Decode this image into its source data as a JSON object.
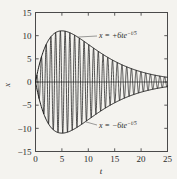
{
  "chart_data": {
    "type": "line",
    "title": "",
    "subtitle": "",
    "xlabel": "t",
    "ylabel": "x",
    "xlim": [
      0,
      25
    ],
    "ylim": [
      -15,
      15
    ],
    "grid": false,
    "legend_position": "none",
    "xticks": [
      0,
      5,
      10,
      15,
      20,
      25
    ],
    "xtick_labels": [
      "0",
      "5",
      "10",
      "15",
      "20",
      "25"
    ],
    "yticks": [
      -15,
      -10,
      -5,
      0,
      5,
      10,
      15
    ],
    "ytick_labels": [
      "-15",
      "-10",
      "-5",
      "0",
      "5",
      "10",
      "15"
    ],
    "series": [
      {
        "name": "oscillation",
        "role": "signal",
        "expression": "x = 6t e^(-t/5) sin(7t)",
        "amplitude_coefficient": 6,
        "decay_tau": 5,
        "angular_frequency": 7,
        "color": "#1c1c1c",
        "points_note": "dense oscillation filling the envelope, ~28 cycles over t=0..25"
      },
      {
        "name": "upper-envelope",
        "role": "envelope",
        "expression": "x = +6t e^(-t/5)",
        "color": "#1c1c1c",
        "x": [
          0,
          1,
          2,
          3,
          4,
          5,
          6,
          7,
          8,
          9,
          10,
          11,
          12,
          13,
          14,
          15,
          16,
          17,
          18,
          19,
          20,
          21,
          22,
          23,
          24,
          25
        ],
        "y": [
          0.0,
          4.91,
          8.04,
          9.88,
          10.78,
          11.04,
          10.84,
          10.35,
          9.69,
          8.93,
          8.12,
          7.31,
          6.53,
          5.79,
          5.11,
          4.48,
          3.91,
          3.4,
          2.94,
          2.54,
          2.18,
          1.87,
          1.59,
          1.36,
          1.15,
          0.98
        ]
      },
      {
        "name": "lower-envelope",
        "role": "envelope",
        "expression": "x = -6t e^(-t/5)",
        "color": "#1c1c1c",
        "x": [
          0,
          1,
          2,
          3,
          4,
          5,
          6,
          7,
          8,
          9,
          10,
          11,
          12,
          13,
          14,
          15,
          16,
          17,
          18,
          19,
          20,
          21,
          22,
          23,
          24,
          25
        ],
        "y": [
          0.0,
          -4.91,
          -8.04,
          -9.88,
          -10.78,
          -11.04,
          -10.84,
          -10.35,
          -9.69,
          -8.93,
          -8.12,
          -7.31,
          -6.53,
          -5.79,
          -5.11,
          -4.48,
          -3.91,
          -3.4,
          -2.94,
          -2.54,
          -2.18,
          -1.87,
          -1.59,
          -1.36,
          -1.15,
          -0.98
        ]
      },
      {
        "name": "zero-line",
        "role": "reference",
        "expression": "x = 0",
        "color": "#3a3a3a"
      }
    ],
    "annotations": [
      {
        "id": "upper-label",
        "lhs": "x",
        "eq": "=",
        "rhs_main": "+6te",
        "rhs_sup": "−t/5",
        "text": "x = +6te−t/5",
        "anchor_t": 8.0,
        "anchor_x": 9.7
      },
      {
        "id": "lower-label",
        "lhs": "x",
        "eq": "=",
        "rhs_main": "−6te",
        "rhs_sup": "−t/5",
        "text": "x = −6te−t/5",
        "anchor_t": 9.5,
        "anchor_x": -8.6
      }
    ],
    "colors": {
      "background": "#f4f3ef",
      "frame": "#4a4a4a",
      "curve": "#1c1c1c",
      "text": "#2b2b2b"
    }
  }
}
